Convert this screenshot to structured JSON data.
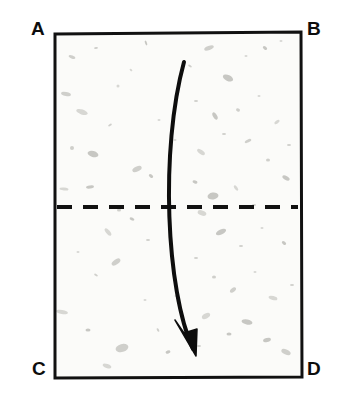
{
  "diagram": {
    "type": "origami-fold-instruction",
    "background_color": "#ffffff",
    "paper": {
      "name": "rectangular-sheet",
      "fill_color": "#fbfbf9",
      "stroke_color": "#111111",
      "stroke_width": 3,
      "corners": {
        "top_left": [
          55,
          34
        ],
        "top_right": [
          301,
          32
        ],
        "bottom_right": [
          302,
          377
        ],
        "bottom_left": [
          55,
          378
        ]
      },
      "texture": "speckled recycled paper flecks",
      "fleck_color": "#b9b9b4"
    },
    "labels": {
      "a": "A",
      "b": "B",
      "c": "C",
      "d": "D"
    },
    "crease_line": {
      "name": "horizontal-fold-crease",
      "style": "dashed",
      "color": "#111111",
      "y": 207,
      "x_start": 57,
      "x_end": 298,
      "dash_length": 15,
      "gap_length": 11,
      "stroke_width": 4
    },
    "fold_arrow": {
      "name": "fold-direction-arrow",
      "color": "#0d0d0d",
      "stroke_width": 4,
      "direction": "downward",
      "start": [
        184,
        62
      ],
      "control_1": [
        160,
        150
      ],
      "control_2": [
        166,
        290
      ],
      "end": [
        193,
        349
      ],
      "tip": [
        196,
        356
      ]
    },
    "flecks": [
      [
        72,
        57,
        7,
        3,
        22
      ],
      [
        96,
        48,
        4,
        2,
        -10
      ],
      [
        131,
        70,
        3,
        2,
        40
      ],
      [
        146,
        43,
        5,
        2,
        70
      ],
      [
        66,
        94,
        10,
        4,
        12
      ],
      [
        82,
        112,
        12,
        5,
        18
      ],
      [
        118,
        86,
        3,
        3,
        0
      ],
      [
        110,
        125,
        4,
        2,
        -30
      ],
      [
        72,
        148,
        4,
        4,
        0
      ],
      [
        93,
        154,
        11,
        6,
        15
      ],
      [
        137,
        169,
        10,
        5,
        -25
      ],
      [
        151,
        176,
        5,
        3,
        40
      ],
      [
        64,
        189,
        9,
        3,
        5
      ],
      [
        90,
        187,
        8,
        3,
        -8
      ],
      [
        119,
        210,
        4,
        3,
        0
      ],
      [
        132,
        219,
        5,
        3,
        25
      ],
      [
        108,
        232,
        9,
        4,
        50
      ],
      [
        78,
        252,
        3,
        2,
        0
      ],
      [
        96,
        275,
        4,
        2,
        30
      ],
      [
        116,
        262,
        10,
        5,
        -35
      ],
      [
        62,
        312,
        12,
        4,
        10
      ],
      [
        88,
        330,
        5,
        3,
        0
      ],
      [
        122,
        348,
        13,
        8,
        -15
      ],
      [
        107,
        366,
        9,
        4,
        20
      ],
      [
        145,
        300,
        3,
        2,
        0
      ],
      [
        158,
        330,
        4,
        2,
        60
      ],
      [
        168,
        352,
        5,
        3,
        -20
      ],
      [
        190,
        66,
        4,
        2,
        30
      ],
      [
        209,
        48,
        10,
        4,
        -20
      ],
      [
        228,
        78,
        11,
        6,
        25
      ],
      [
        246,
        56,
        3,
        2,
        0
      ],
      [
        265,
        48,
        5,
        3,
        40
      ],
      [
        281,
        41,
        3,
        2,
        0
      ],
      [
        196,
        101,
        4,
        2,
        0
      ],
      [
        215,
        116,
        8,
        4,
        60
      ],
      [
        238,
        110,
        4,
        3,
        20
      ],
      [
        259,
        96,
        3,
        2,
        0
      ],
      [
        277,
        122,
        6,
        3,
        -35
      ],
      [
        289,
        145,
        4,
        2,
        0
      ],
      [
        201,
        152,
        9,
        4,
        35
      ],
      [
        224,
        134,
        4,
        2,
        0
      ],
      [
        248,
        141,
        7,
        3,
        -25
      ],
      [
        268,
        160,
        4,
        3,
        0
      ],
      [
        286,
        178,
        8,
        4,
        30
      ],
      [
        195,
        182,
        5,
        3,
        15
      ],
      [
        213,
        196,
        11,
        7,
        -10
      ],
      [
        236,
        188,
        6,
        3,
        55
      ],
      [
        254,
        205,
        4,
        2,
        0
      ],
      [
        202,
        213,
        9,
        5,
        20
      ],
      [
        221,
        232,
        11,
        5,
        -25
      ],
      [
        241,
        246,
        4,
        2,
        0
      ],
      [
        262,
        228,
        3,
        2,
        0
      ],
      [
        284,
        243,
        5,
        3,
        40
      ],
      [
        196,
        258,
        4,
        2,
        0
      ],
      [
        214,
        277,
        4,
        3,
        0
      ],
      [
        233,
        290,
        7,
        4,
        -40
      ],
      [
        255,
        272,
        3,
        2,
        0
      ],
      [
        273,
        298,
        9,
        4,
        15
      ],
      [
        292,
        285,
        4,
        2,
        0
      ],
      [
        206,
        316,
        9,
        5,
        -30
      ],
      [
        229,
        334,
        5,
        3,
        0
      ],
      [
        247,
        322,
        11,
        5,
        10
      ],
      [
        267,
        340,
        8,
        4,
        -15
      ],
      [
        286,
        352,
        10,
        5,
        25
      ],
      [
        199,
        346,
        4,
        2,
        0
      ],
      [
        159,
        120,
        3,
        2,
        0
      ],
      [
        148,
        240,
        4,
        2,
        0
      ],
      [
        176,
        296,
        3,
        2,
        0
      ],
      [
        175,
        140,
        3,
        2,
        0
      ]
    ]
  }
}
